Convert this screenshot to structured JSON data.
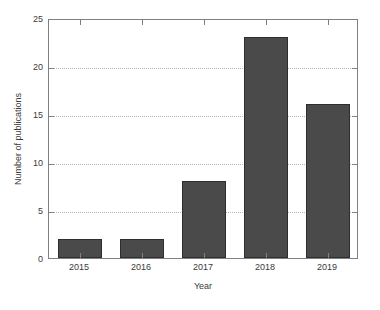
{
  "chart_data": {
    "type": "bar",
    "title": "",
    "subtitle": "",
    "xlabel": "Year",
    "ylabel": "Number of publications",
    "categories": [
      "2015",
      "2016",
      "2017",
      "2018",
      "2019"
    ],
    "values": [
      2,
      2,
      8,
      23,
      16
    ],
    "series": [
      {
        "name": "Number of publications",
        "values": [
          2,
          2,
          8,
          23,
          16
        ]
      }
    ],
    "ylim": [
      0,
      25
    ],
    "yticks": [
      0,
      5,
      10,
      15,
      20,
      25
    ],
    "ytick_labels": [
      "0",
      "5",
      "10",
      "15",
      "20",
      "25"
    ],
    "xtick_labels": [
      "2015",
      "2016",
      "2017",
      "2018",
      "2019"
    ],
    "grid": "horizontal-dotted",
    "legend": "none",
    "annotations": [],
    "colors": {
      "bar_fill": "#4a4a4a",
      "bar_edge": "#2e2e2e",
      "axis": "#808080",
      "grid": "#b4b4b4",
      "text": "#3a3a3a",
      "background": "#ffffff"
    }
  }
}
